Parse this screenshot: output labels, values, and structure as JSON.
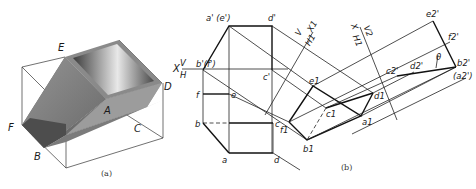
{
  "figure_a": {
    "caption": "(a)",
    "labels": {
      "E": "E",
      "D": "D",
      "A": "A",
      "F": "F",
      "C": "C",
      "B": "B"
    }
  },
  "figure_b": {
    "caption": "(b)",
    "front_view_labels": {
      "a_prime_e_prime": "a' (e')",
      "d_prime": "d'",
      "b_prime_f_prime": "b'(f')",
      "c_prime": "c'"
    },
    "axis_labels": {
      "x_axis": "X",
      "v": "V",
      "h": "H",
      "x1_axis": "V X1 / H1",
      "x1_v": "V",
      "x1_x": "X1",
      "x1_h": "H1",
      "x2_x": "X",
      "x2_v": "V2",
      "x2_h": "H1"
    },
    "top_view_labels": {
      "f": "f",
      "e": "e",
      "b": "b",
      "c": "c",
      "a": "a",
      "d": "d"
    },
    "aux_view_1_labels": {
      "e1": "e1",
      "d1": "d1",
      "c1": "c1",
      "a1": "a1",
      "b1": "b1",
      "f1": "f1"
    },
    "aux_view_2_labels": {
      "e2": "e2'",
      "f2": "f2'",
      "c2": "c2'",
      "d2": "d2'",
      "b2": "b2'",
      "a2": "(a2')",
      "angle": "θ"
    }
  }
}
